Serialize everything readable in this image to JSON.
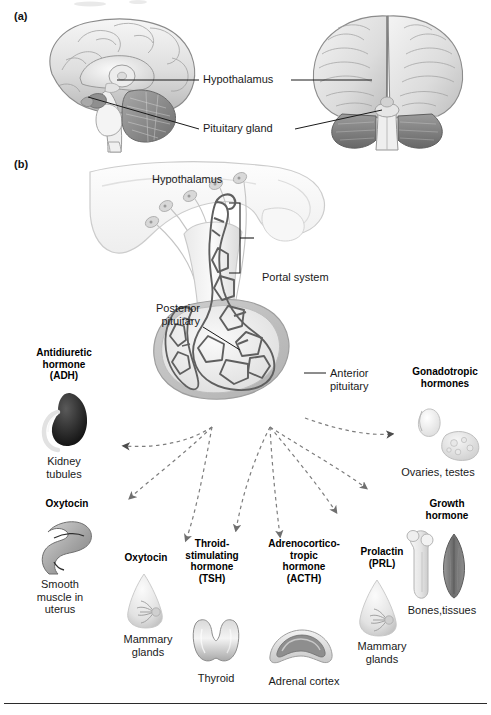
{
  "figure": {
    "panel_a_tag": "(a)",
    "panel_b_tag": "(b)"
  },
  "panel_a": {
    "labels": [
      {
        "name": "hypothalamus",
        "text": "Hypothalamus"
      },
      {
        "name": "pituitary-gland",
        "text": "Pituitary gland"
      }
    ],
    "views": [
      {
        "name": "midsagittal-brain-section",
        "caption": ""
      },
      {
        "name": "posterior-brain-view",
        "caption": ""
      }
    ]
  },
  "panel_b": {
    "structure_labels": {
      "hypothalamus": "Hypothalamus",
      "portal_system": "Portal system",
      "posterior_pituitary": "Posterior\npituitary",
      "anterior_pituitary": "Anterior\npituitary"
    },
    "posterior_hormones": [
      {
        "hormone": "Antidiuretic\nhormone\n(ADH)",
        "target": "Kidney\ntubules",
        "organ_icon": "kidney-icon"
      },
      {
        "hormone": "Oxytocin",
        "target": "Smooth\nmuscle in\nuterus",
        "organ_icon": "uterus-icon"
      }
    ],
    "anterior_hormones": [
      {
        "hormone": "Oxytocin",
        "target": "Mammary\nglands",
        "organ_icon": "mammary-gland-icon"
      },
      {
        "hormone": "Throid-\nstimulating\nhormone\n(TSH)",
        "target": "Thyroid",
        "organ_icon": "thyroid-icon"
      },
      {
        "hormone": "Adrenocortico-\ntropic\nhormone\n(ACTH)",
        "target": "Adrenal cortex",
        "organ_icon": "adrenal-cortex-icon"
      },
      {
        "hormone": "Prolactin\n(PRL)",
        "target": "Mammary\nglands",
        "organ_icon": "mammary-gland-icon"
      },
      {
        "hormone": "Growth\nhormone",
        "target": "Bones,tissues",
        "organ_icon": "bone-muscle-icon"
      },
      {
        "hormone": "Gonadotropic\nhormones",
        "target": "Ovaries, testes",
        "organ_icon": "ovary-testis-icon"
      }
    ]
  },
  "colors": {
    "text": "#1a1a1a",
    "leader_line": "#1a1a1a",
    "arrow_fill": "#6b6b6b",
    "arrow_dark": "#4a4a4a",
    "vessel": "#585858",
    "tissue_light": "#f2f2f2",
    "tissue_mid": "#c9c9c9",
    "tissue_dark": "#8e8e8e",
    "rule": "#2b2b2b"
  }
}
